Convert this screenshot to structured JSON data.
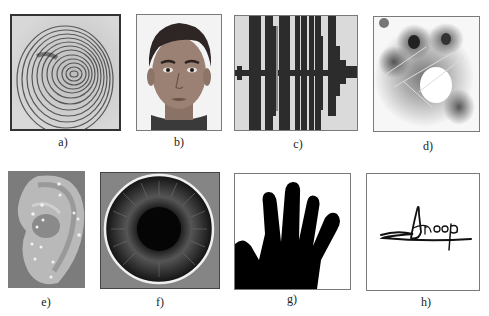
{
  "figure": {
    "panels": [
      {
        "id": "a",
        "label": "a)",
        "content": "fingerprint"
      },
      {
        "id": "b",
        "label": "b)",
        "content": "face"
      },
      {
        "id": "c",
        "label": "c)",
        "content": "voice waveform"
      },
      {
        "id": "d",
        "label": "d)",
        "content": "palmprint"
      },
      {
        "id": "e",
        "label": "e)",
        "content": "ear with landmark points"
      },
      {
        "id": "f",
        "label": "f)",
        "content": "iris"
      },
      {
        "id": "g",
        "label": "g)",
        "content": "hand geometry silhouette"
      },
      {
        "id": "h",
        "label": "h)",
        "content": "signature"
      }
    ],
    "signature_text": "Anoop"
  }
}
